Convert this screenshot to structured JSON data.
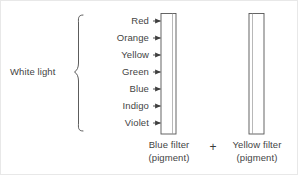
{
  "figure": {
    "white_light_label": "White light",
    "plus_sign": "+",
    "background_color": "#ffffff",
    "line_color": "#4a4a4a",
    "text_color": "#444444",
    "filter_fill": "#ffffff",
    "filter_stroke": "#555555"
  },
  "spectrum": {
    "brace_label": "White light",
    "colors": [
      {
        "name": "Red",
        "y": 20
      },
      {
        "name": "Orange",
        "y": 37
      },
      {
        "name": "Yellow",
        "y": 54
      },
      {
        "name": "Green",
        "y": 71
      },
      {
        "name": "Blue",
        "y": 88
      },
      {
        "name": "Indigo",
        "y": 105
      },
      {
        "name": "Violet",
        "y": 122
      }
    ]
  },
  "filters": [
    {
      "id": "blue-filter",
      "name": "Blue filter",
      "sub": "(pigment)",
      "caption": "Blue filter\n(pigment)"
    },
    {
      "id": "yellow-filter",
      "name": "Yellow filter",
      "sub": "(pigment)",
      "caption": "Yellow filter\n(pigment)"
    }
  ]
}
